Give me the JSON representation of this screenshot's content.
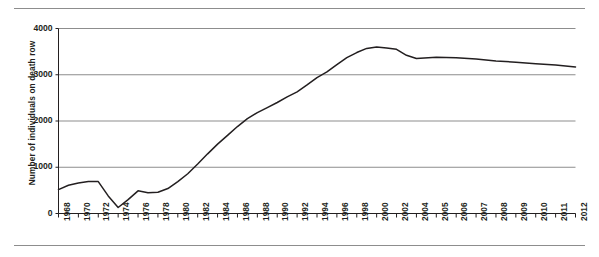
{
  "chart_data": {
    "type": "line",
    "title": "",
    "xlabel": "",
    "ylabel": "Number of individuals on death row",
    "ylim": [
      0,
      4000
    ],
    "yticks": [
      0,
      1000,
      2000,
      3000,
      4000
    ],
    "ytick_labels": [
      "0",
      "1000",
      "2000",
      "3000",
      "4000"
    ],
    "grid": true,
    "legend": false,
    "x": [
      1968,
      1969,
      1970,
      1971,
      1972,
      1973,
      1974,
      1975,
      1976,
      1977,
      1978,
      1979,
      1980,
      1981,
      1982,
      1983,
      1984,
      1985,
      1986,
      1987,
      1988,
      1989,
      1990,
      1991,
      1992,
      1993,
      1994,
      1995,
      1996,
      1997,
      1998,
      1999,
      2000,
      2001,
      2002,
      2003,
      2004,
      2005,
      2006,
      2007,
      2008,
      2009,
      2010,
      2011,
      2012
    ],
    "xtick_labels": [
      "1968",
      "1970",
      "1972",
      "1974",
      "1976",
      "1978",
      "1980",
      "1982",
      "1984",
      "1986",
      "1988",
      "1990",
      "1992",
      "1994",
      "1996",
      "1998",
      "2000",
      "2002",
      "2004",
      "2005",
      "2006",
      "2007",
      "2008",
      "2009",
      "2010",
      "2011",
      "2012"
    ],
    "xticks_values": [
      1968,
      1970,
      1972,
      1974,
      1976,
      1978,
      1980,
      1982,
      1984,
      1986,
      1988,
      1990,
      1992,
      1994,
      1996,
      1998,
      2000,
      2002,
      2004,
      2005,
      2006,
      2007,
      2008,
      2009,
      2010,
      2011,
      2012
    ],
    "values": [
      517,
      610,
      660,
      690,
      690,
      380,
      130,
      300,
      490,
      450,
      460,
      540,
      690,
      860,
      1070,
      1290,
      1500,
      1690,
      1880,
      2050,
      2180,
      2290,
      2400,
      2520,
      2630,
      2780,
      2940,
      3060,
      3220,
      3370,
      3480,
      3570,
      3600,
      3580,
      3550,
      3420,
      3350,
      3380,
      3370,
      3340,
      3300,
      3270,
      3240,
      3210,
      3170
    ],
    "series_name": "Number of individuals on death row",
    "line_color": "#231f20",
    "grid_color": "#8d8d8d",
    "axis_color": "#231f20"
  }
}
